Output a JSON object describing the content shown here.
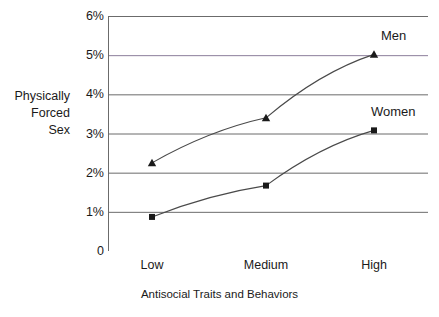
{
  "chart_data": {
    "type": "line",
    "title": "",
    "subtitle": "",
    "xlabel": "Antisocial Traits and Behaviors",
    "ylabel": "Physically Forced Sex",
    "ylabel_lines": [
      "Physically",
      "Forced",
      "Sex"
    ],
    "categories": [
      "Low",
      "Medium",
      "High"
    ],
    "series": [
      {
        "name": "Men",
        "values": [
          2.25,
          3.4,
          5.02
        ],
        "marker": "triangle",
        "color": "#1a1a1a"
      },
      {
        "name": "Women",
        "values": [
          0.87,
          1.67,
          3.08
        ],
        "marker": "square",
        "color": "#1a1a1a"
      }
    ],
    "ylim": [
      0,
      6
    ],
    "yticks": [
      0,
      1,
      2,
      3,
      4,
      5,
      6
    ],
    "ytick_labels": [
      "0",
      "1%",
      "2%",
      "3%",
      "4%",
      "5%",
      "6%"
    ],
    "grid": true,
    "grid_color": "#6b6b6b",
    "highlight_gridline": {
      "value": 5,
      "color": "#8b7d9b"
    },
    "legend_position": "inline-right",
    "axis_color": "#6b6b6b",
    "line_color": "#4a4a4a",
    "background": "#ffffff"
  },
  "labels": {
    "series_men": "Men",
    "series_women": "Women"
  }
}
